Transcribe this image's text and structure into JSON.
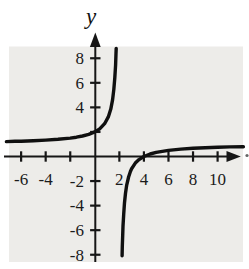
{
  "figure": {
    "y_axis_title": "y",
    "x_axis_end_mark": ".",
    "colors": {
      "plot_background": "#edece9",
      "page_background": "#ffffff",
      "axis_stroke": "#161616",
      "curve_stroke": "#101010",
      "label_color": "#1b1b1b",
      "edge_mark_color": "#4a4a4a"
    }
  },
  "chart_data": {
    "type": "line",
    "title": "",
    "xlabel": "",
    "ylabel": "y",
    "xlim": [
      -7.4,
      12.1
    ],
    "ylim": [
      -8.9,
      8.9
    ],
    "grid": false,
    "tick_step": 2,
    "vertical_asymptote_x": 2,
    "horizontal_asymptote_y": 1,
    "function_hint": "y = (x-4)/(x-2)",
    "x_ticks": [
      {
        "v": -6,
        "label": "-6"
      },
      {
        "v": -4,
        "label": "-4"
      },
      {
        "v": -2,
        "label": ""
      },
      {
        "v": 2,
        "label": "2"
      },
      {
        "v": 4,
        "label": "4"
      },
      {
        "v": 6,
        "label": "6"
      },
      {
        "v": 8,
        "label": "8"
      },
      {
        "v": 10,
        "label": "10"
      }
    ],
    "y_ticks": [
      {
        "v": 8,
        "label": "8"
      },
      {
        "v": 6,
        "label": "6"
      },
      {
        "v": 4,
        "label": "4"
      },
      {
        "v": 2,
        "label": ""
      },
      {
        "v": -2,
        "label": "-2"
      },
      {
        "v": -4,
        "label": "-4"
      },
      {
        "v": -6,
        "label": "-6"
      },
      {
        "v": -8,
        "label": "-8"
      }
    ],
    "series": [
      {
        "name": "left branch",
        "points": [
          [
            -7.2,
            1.217
          ],
          [
            -6.5,
            1.235
          ],
          [
            -6,
            1.25
          ],
          [
            -5,
            1.286
          ],
          [
            -4,
            1.333
          ],
          [
            -3,
            1.4
          ],
          [
            -2,
            1.5
          ],
          [
            -1.5,
            1.571
          ],
          [
            -1,
            1.667
          ],
          [
            -0.5,
            1.8
          ],
          [
            0,
            2
          ],
          [
            0.4,
            2.25
          ],
          [
            0.8,
            2.667
          ],
          [
            1.1,
            3.222
          ],
          [
            1.3,
            3.857
          ],
          [
            1.45,
            4.636
          ],
          [
            1.55,
            5.444
          ],
          [
            1.63,
            6.405
          ],
          [
            1.69,
            7.452
          ],
          [
            1.73,
            8.407
          ],
          [
            1.745,
            8.8
          ]
        ]
      },
      {
        "name": "right branch",
        "points": [
          [
            2.22,
            -8.09
          ],
          [
            2.24,
            -7.333
          ],
          [
            2.27,
            -6.407
          ],
          [
            2.3,
            -5.667
          ],
          [
            2.35,
            -4.714
          ],
          [
            2.42,
            -3.762
          ],
          [
            2.5,
            -3
          ],
          [
            2.6,
            -2.333
          ],
          [
            2.75,
            -1.667
          ],
          [
            2.9,
            -1.222
          ],
          [
            3,
            -1
          ],
          [
            3.3,
            -0.538
          ],
          [
            3.6,
            -0.25
          ],
          [
            4,
            0
          ],
          [
            4.5,
            0.2
          ],
          [
            5,
            0.333
          ],
          [
            6,
            0.5
          ],
          [
            7,
            0.6
          ],
          [
            8,
            0.667
          ],
          [
            9,
            0.714
          ],
          [
            10,
            0.75
          ],
          [
            11,
            0.778
          ],
          [
            12.1,
            0.802
          ]
        ]
      }
    ]
  }
}
